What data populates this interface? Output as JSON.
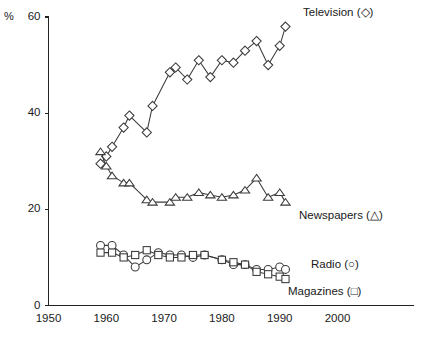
{
  "chart_data": {
    "type": "line",
    "title": "",
    "subtitle": "",
    "xlabel": "",
    "ylabel": "%",
    "xlim": [
      1950,
      2005
    ],
    "ylim": [
      0,
      60
    ],
    "grid": false,
    "legend_position": "inline-right",
    "y_ticks": [
      0,
      20,
      40,
      60
    ],
    "y_tick_labels": [
      "0",
      "20",
      "40",
      "60"
    ],
    "x_ticks": [
      1950,
      1960,
      1970,
      1980,
      1990,
      2000
    ],
    "x_tick_labels": [
      "1950",
      "1960",
      "1970",
      "1980",
      "1990",
      "2000"
    ],
    "series": [
      {
        "name": "Television",
        "marker": "diamond",
        "legend_label": "Television (◇)",
        "x": [
          1959,
          1960,
          1961,
          1963,
          1964,
          1967,
          1968,
          1971,
          1972,
          1974,
          1976,
          1978,
          1980,
          1982,
          1984,
          1986,
          1988,
          1990,
          1991
        ],
        "values": [
          29.5,
          31.0,
          33.0,
          37.0,
          39.5,
          36.0,
          41.5,
          48.5,
          49.5,
          47.0,
          51.0,
          47.5,
          51.0,
          50.5,
          53.0,
          55.0,
          50.0,
          54.0,
          58.0
        ]
      },
      {
        "name": "Newspapers",
        "marker": "triangle",
        "legend_label": "Newspapers (△)",
        "x": [
          1959,
          1960,
          1961,
          1963,
          1964,
          1967,
          1968,
          1971,
          1972,
          1974,
          1976,
          1978,
          1980,
          1982,
          1984,
          1986,
          1988,
          1990,
          1991
        ],
        "values": [
          32.0,
          29.0,
          27.0,
          25.5,
          25.5,
          22.0,
          21.5,
          21.5,
          22.5,
          22.5,
          23.5,
          23.0,
          22.5,
          23.0,
          24.0,
          26.5,
          22.5,
          23.5,
          21.5
        ]
      },
      {
        "name": "Radio",
        "marker": "circle",
        "legend_label": "Radio (○)",
        "x": [
          1959,
          1961,
          1963,
          1965,
          1967,
          1969,
          1971,
          1973,
          1975,
          1977,
          1980,
          1982,
          1984,
          1986,
          1988,
          1990,
          1991
        ],
        "values": [
          12.5,
          12.5,
          10.5,
          8.0,
          9.5,
          11.0,
          10.5,
          10.5,
          10.0,
          10.5,
          9.5,
          8.5,
          8.5,
          7.5,
          7.5,
          8.0,
          7.5
        ]
      },
      {
        "name": "Magazines",
        "marker": "square",
        "legend_label": "Magazines (□)",
        "x": [
          1959,
          1961,
          1963,
          1965,
          1967,
          1969,
          1971,
          1973,
          1975,
          1977,
          1980,
          1982,
          1984,
          1986,
          1988,
          1990,
          1991
        ],
        "values": [
          11.0,
          11.0,
          10.0,
          10.5,
          11.5,
          10.5,
          10.0,
          10.0,
          10.5,
          10.5,
          9.5,
          9.0,
          8.5,
          7.0,
          6.5,
          6.0,
          5.5
        ]
      }
    ]
  },
  "axis": {
    "y_title": "%"
  },
  "legend": {
    "television": "Television (◇)",
    "newspapers": "Newspapers (△)",
    "radio": "Radio (○)",
    "magazines": "Magazines (□)"
  }
}
